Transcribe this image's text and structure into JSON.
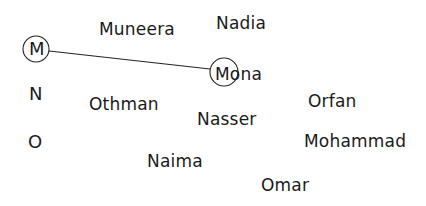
{
  "worksheet": {
    "letters": [
      {
        "text": "M",
        "circled": true
      },
      {
        "text": "N",
        "circled": false
      },
      {
        "text": "O",
        "circled": false
      }
    ],
    "names": [
      {
        "text": "Muneera"
      },
      {
        "text": "Nadia"
      },
      {
        "text": "Mona",
        "circled_initial": true
      },
      {
        "text": "Othman"
      },
      {
        "text": "Nasser"
      },
      {
        "text": "Orfan"
      },
      {
        "text": "Mohammad"
      },
      {
        "text": "Naima"
      },
      {
        "text": "Omar"
      }
    ],
    "connections": [
      {
        "from": "M",
        "to": "Mona"
      }
    ],
    "ink_color": "#1a1a1a"
  }
}
